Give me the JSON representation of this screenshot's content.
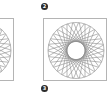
{
  "figure": {
    "badges": [
      {
        "label": "2"
      },
      {
        "label": "3"
      }
    ],
    "panels": [
      {
        "name": "left-partial",
        "x": -50,
        "y": 18,
        "w": 64,
        "h": 63
      },
      {
        "name": "right",
        "x": 43,
        "y": 18,
        "w": 64,
        "h": 63
      }
    ],
    "rosette": {
      "outer_radius": 28,
      "inner_radius": 9,
      "chords": 30,
      "line_color": "#8a8a8a",
      "border_color": "#b4b4b4"
    }
  }
}
